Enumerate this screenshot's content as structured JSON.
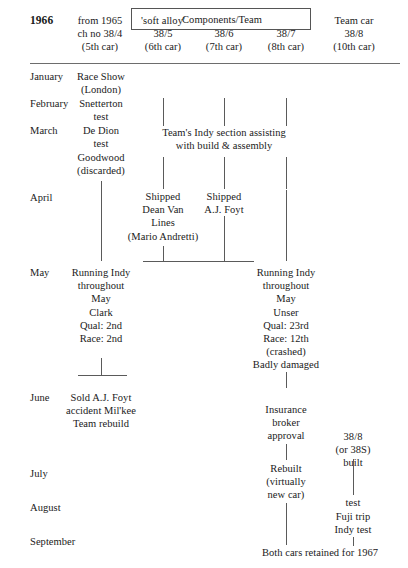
{
  "header": {
    "year": "1966",
    "col1": "from 1965\nch no 38/4\n(5th car)",
    "boxed_label": "'soft alloy'",
    "components_team": "Components/Team",
    "col2": "38/5\n(6th car)",
    "col3": "38/6\n(7th car)",
    "col4": "38/7\n(8th car)",
    "col5": "Team car\n38/8\n(10th car)"
  },
  "months": {
    "january": "January",
    "february": "February",
    "march": "March",
    "april": "April",
    "may": "May",
    "june": "June",
    "july": "July",
    "august": "August",
    "september": "September"
  },
  "entries": {
    "race_show": "Race Show\n(London)",
    "snetterton": "Snetterton\ntest",
    "de_dion": "De Dion\ntest",
    "goodwood": "Goodwood\n(discarded)",
    "team_indy_section": "Team's Indy section assisting\nwith build & assembly",
    "shipped_dean_van_lines": "Shipped\nDean Van\nLines\n(Mario Andretti)",
    "shipped_aj_foyt": "Shipped\nA.J. Foyt",
    "running_indy_clark": "Running Indy\nthroughout\nMay\nClark\nQual: 2nd\nRace: 2nd",
    "running_indy_unser": "Running Indy\nthroughout\nMay\nUnser\nQual: 23rd\nRace: 12th\n(crashed)\nBadly damaged",
    "sold_aj_foyt": "Sold A.J. Foyt\naccident Mil'kee\nTeam rebuild",
    "insurance": "Insurance\nbroker\napproval",
    "rebuilt": "Rebuilt\n(virtually\nnew car)",
    "built_38_8": "38/8\n(or 38S) built",
    "test": "test",
    "fuji_indy": "Fuji trip\nIndy test",
    "both_cars": "Both cars retained for 1967"
  }
}
